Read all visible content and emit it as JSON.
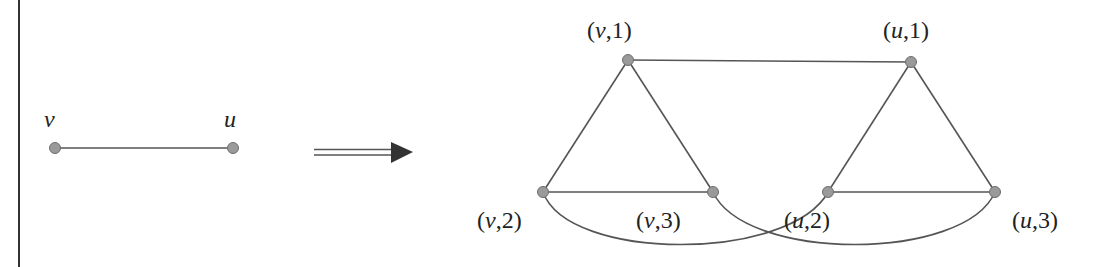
{
  "diagram": {
    "type": "graph-transformation",
    "source_graph": {
      "nodes": [
        {
          "id": "v",
          "label": "v",
          "x": 55,
          "y": 148
        },
        {
          "id": "u",
          "label": "u",
          "x": 233,
          "y": 148
        }
      ],
      "edges": [
        {
          "from": "v",
          "to": "u",
          "kind": "straight"
        }
      ],
      "labels": {
        "v": "v",
        "u": "u"
      }
    },
    "arrow": {
      "kind": "double-shaft-arrow",
      "direction": "right",
      "meaning": "transforms-to"
    },
    "target_graph": {
      "nodes": [
        {
          "id": "v1",
          "vertex": "v",
          "index": "1",
          "x": 628,
          "y": 60
        },
        {
          "id": "v2",
          "vertex": "v",
          "index": "2",
          "x": 543,
          "y": 192
        },
        {
          "id": "v3",
          "vertex": "v",
          "index": "3",
          "x": 713,
          "y": 192
        },
        {
          "id": "u1",
          "vertex": "u",
          "index": "1",
          "x": 911,
          "y": 60
        },
        {
          "id": "u2",
          "vertex": "u",
          "index": "2",
          "x": 828,
          "y": 192
        },
        {
          "id": "u3",
          "vertex": "u",
          "index": "3",
          "x": 995,
          "y": 192
        }
      ],
      "edges": [
        {
          "from": "v1",
          "to": "u1",
          "kind": "straight"
        },
        {
          "from": "v1",
          "to": "v2",
          "kind": "straight"
        },
        {
          "from": "v1",
          "to": "v3",
          "kind": "straight"
        },
        {
          "from": "v2",
          "to": "v3",
          "kind": "straight"
        },
        {
          "from": "u1",
          "to": "u2",
          "kind": "straight"
        },
        {
          "from": "u1",
          "to": "u3",
          "kind": "straight"
        },
        {
          "from": "u2",
          "to": "u3",
          "kind": "straight"
        },
        {
          "from": "v2",
          "to": "u2",
          "kind": "curved"
        },
        {
          "from": "v3",
          "to": "u3",
          "kind": "curved"
        }
      ],
      "labels": {
        "v1": {
          "name": "v",
          "index": "1"
        },
        "v2": {
          "name": "v",
          "index": "2"
        },
        "v3": {
          "name": "v",
          "index": "3"
        },
        "u1": {
          "name": "u",
          "index": "1"
        },
        "u2": {
          "name": "u",
          "index": "2"
        },
        "u3": {
          "name": "u",
          "index": "3"
        }
      }
    },
    "colors": {
      "edge": "#555555",
      "node_fill": "#9a9a9a",
      "node_stroke": "#6e6e6e",
      "arrow": "#333333",
      "text": "#222222",
      "left_border": "#333333"
    }
  }
}
